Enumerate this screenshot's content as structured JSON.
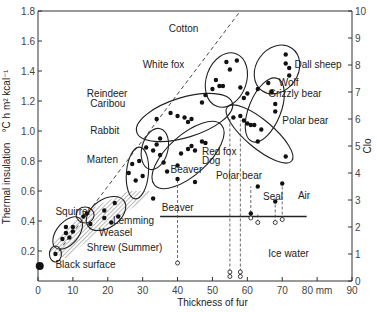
{
  "chart_data": {
    "type": "scatter",
    "title": "",
    "xlabel": "Thickness of fur",
    "xunit": "mm",
    "ylabel": "Thermal insulation",
    "ylabel_unit": "°C h m² kcal⁻¹",
    "y2label": "Clo",
    "xlim": [
      0,
      90
    ],
    "ylim": [
      0,
      1.8
    ],
    "y2lim": [
      0,
      10
    ],
    "xticks": [
      0,
      10,
      20,
      30,
      40,
      50,
      60,
      70,
      80,
      90
    ],
    "xtick_labels": [
      "0",
      "10",
      "20",
      "30",
      "40",
      "50",
      "60",
      "70",
      "80 mm",
      "90"
    ],
    "yticks": [
      0.2,
      0.4,
      0.6,
      0.8,
      1.0,
      1.2,
      1.4,
      1.6,
      1.8
    ],
    "ytick_labels": [
      "0.2",
      "0.4",
      "0.6",
      "0.8",
      "1.0",
      "1.2",
      "1.4",
      "1.6",
      "1.8"
    ],
    "y2ticks": [
      0,
      1,
      2,
      3,
      4,
      5,
      6,
      7,
      8,
      9,
      10
    ],
    "grid": false,
    "legend": null,
    "reference_lines": [
      {
        "name": "Cotton",
        "style": "dashed",
        "from": [
          6,
          0.2
        ],
        "to": [
          58,
          1.8
        ]
      }
    ],
    "annotations": [
      "Cotton",
      "White fox",
      "Reindeer Caribou",
      "Rabbit",
      "Marten",
      "Squirrel",
      "Lemming",
      "Weasel",
      "Shrew (Summer)",
      "Black surface",
      "Beaver",
      "Red fox",
      "Dog",
      "Dall sheep",
      "Wolf",
      "Grizzly bear",
      "Polar bear",
      "Seal",
      "Air",
      "Ice water"
    ],
    "regions": {
      "air_ice_boundary_y": 0.43,
      "air_label": "Air",
      "ice_label": "Ice water"
    },
    "series": [
      {
        "name": "Black surface",
        "points": [
          [
            0.5,
            0.1
          ]
        ]
      },
      {
        "name": "Shrew (Summer)",
        "points": [
          [
            5,
            0.18
          ]
        ]
      },
      {
        "name": "Squirrel",
        "points": [
          [
            7,
            0.28
          ],
          [
            8,
            0.32
          ],
          [
            8,
            0.36
          ],
          [
            9,
            0.29
          ],
          [
            10,
            0.33
          ],
          [
            10,
            0.36
          ]
        ]
      },
      {
        "name": "Lemming",
        "points": [
          [
            13,
            0.43
          ],
          [
            14,
            0.45
          ]
        ]
      },
      {
        "name": "Weasel",
        "points": [
          [
            15,
            0.38
          ],
          [
            19,
            0.42
          ],
          [
            19,
            0.47
          ],
          [
            21,
            0.39
          ],
          [
            22,
            0.52
          ],
          [
            23,
            0.43
          ]
        ]
      },
      {
        "name": "Marten",
        "points": [
          [
            26,
            0.72
          ],
          [
            27,
            0.78
          ],
          [
            28,
            0.67
          ],
          [
            29,
            0.8
          ],
          [
            30,
            0.7
          ],
          [
            33,
            0.55
          ]
        ]
      },
      {
        "name": "Rabbit",
        "points": [
          [
            31,
            0.89
          ],
          [
            33,
            0.87
          ],
          [
            34,
            0.91
          ],
          [
            35,
            0.95
          ],
          [
            35,
            0.84
          ],
          [
            36,
            0.79
          ]
        ]
      },
      {
        "name": "Reindeer Caribou",
        "points": [
          [
            34,
            1.08
          ],
          [
            38,
            1.12
          ],
          [
            40,
            1.1
          ],
          [
            42,
            1.09
          ],
          [
            43,
            1.06
          ],
          [
            44,
            1.08
          ]
        ]
      },
      {
        "name": "Red fox / Dog / Beaver",
        "points": [
          [
            37,
            0.73
          ],
          [
            40,
            0.77
          ],
          [
            41,
            0.85
          ],
          [
            43,
            0.88
          ],
          [
            44,
            0.9
          ],
          [
            45,
            0.87
          ],
          [
            47,
            0.93
          ],
          [
            48,
            0.92
          ],
          [
            40,
            0.68
          ],
          [
            45,
            0.66
          ]
        ]
      },
      {
        "name": "White fox",
        "points": [
          [
            47,
            1.19
          ],
          [
            48,
            1.24
          ],
          [
            50,
            1.28
          ],
          [
            51,
            1.34
          ],
          [
            52,
            1.3
          ],
          [
            53,
            1.3
          ],
          [
            54,
            1.46
          ],
          [
            55,
            1.41
          ],
          [
            57,
            1.47
          ],
          [
            58,
            1.29
          ],
          [
            59,
            1.22
          ],
          [
            60,
            1.25
          ]
        ]
      },
      {
        "name": "Wolf / Grizzly bear",
        "points": [
          [
            60,
            1.05
          ],
          [
            61,
            1.04
          ],
          [
            62,
            1.04
          ],
          [
            64,
            1.01
          ],
          [
            67,
            1.26
          ],
          [
            68,
            1.18
          ],
          [
            68,
            1.13
          ]
        ]
      },
      {
        "name": "Dall sheep",
        "points": [
          [
            63,
            1.28
          ],
          [
            66,
            1.32
          ],
          [
            71,
            1.51
          ],
          [
            71,
            1.45
          ],
          [
            72,
            1.42
          ],
          [
            72,
            1.37
          ]
        ]
      },
      {
        "name": "Polar bear (air)",
        "points": [
          [
            56,
            1.09
          ],
          [
            58,
            1.1
          ],
          [
            59,
            1.07
          ],
          [
            63,
            0.93
          ],
          [
            71,
            0.83
          ]
        ]
      },
      {
        "name": "Seal (air)",
        "points": [
          [
            63,
            0.63
          ],
          [
            68,
            0.53
          ],
          [
            70,
            0.65
          ],
          [
            61,
            0.45
          ]
        ]
      },
      {
        "name": "Beaver (ice water)",
        "hollow": true,
        "points": [
          [
            40,
            0.12
          ]
        ]
      },
      {
        "name": "Polar bear (ice water)",
        "hollow": true,
        "points": [
          [
            55,
            0.03
          ],
          [
            55,
            0.06
          ],
          [
            58,
            0.03
          ],
          [
            58,
            0.06
          ]
        ]
      },
      {
        "name": "Seal (ice water)",
        "hollow": true,
        "points": [
          [
            61,
            0.42
          ],
          [
            63,
            0.39
          ],
          [
            68,
            0.39
          ],
          [
            70,
            0.41
          ]
        ]
      }
    ]
  }
}
